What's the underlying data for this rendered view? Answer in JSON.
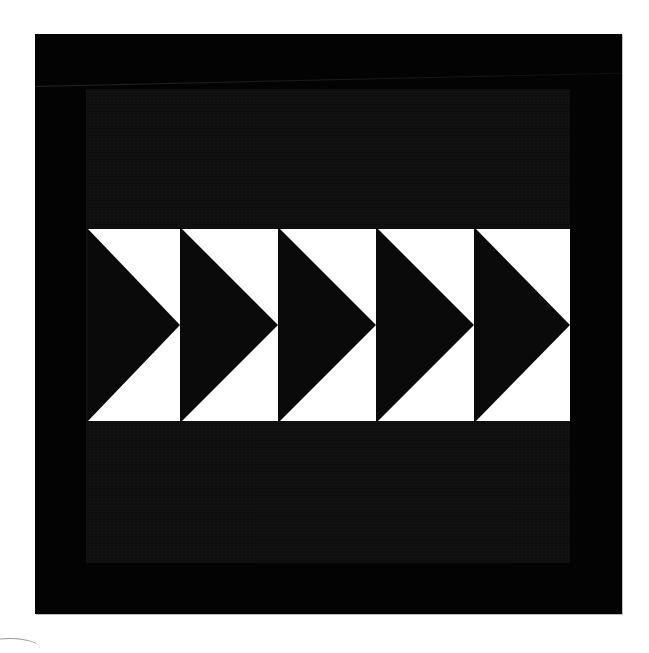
{
  "image": {
    "subject": "flying-geese-quilt-block",
    "colors": {
      "background": "#ffffff",
      "outer_border": "#030303",
      "inner_panel": "#0e0e0e",
      "goose_dark": "#0a0a0a",
      "sky_light": "#ffffff"
    },
    "geese": [
      {
        "index": 1,
        "left": 0,
        "width": 92
      },
      {
        "index": 2,
        "left": 94,
        "width": 96
      },
      {
        "index": 3,
        "left": 192,
        "width": 96
      },
      {
        "index": 4,
        "left": 290,
        "width": 96
      },
      {
        "index": 5,
        "left": 388,
        "width": 94
      }
    ],
    "direction": "right"
  }
}
